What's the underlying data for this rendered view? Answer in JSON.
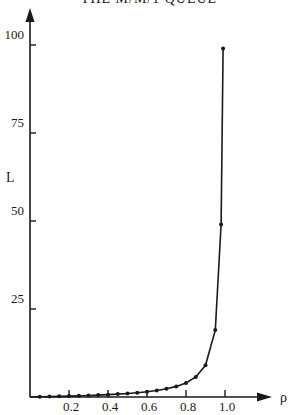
{
  "chart_data": {
    "type": "line",
    "title": "THE M/M/1 QUEUE",
    "xlabel": "ρ",
    "ylabel": "L",
    "xlim": [
      0,
      1.0
    ],
    "ylim": [
      0,
      105
    ],
    "x_ticks": [
      0.2,
      0.4,
      0.6,
      0.8,
      1.0
    ],
    "x_tick_labels": [
      "0.2",
      "0.4",
      "0.6",
      "0.8",
      "1.0"
    ],
    "y_ticks": [
      25,
      50,
      75,
      100
    ],
    "y_tick_labels": [
      "25",
      "50",
      "75",
      "100"
    ],
    "grid": false,
    "legend": null,
    "series": [
      {
        "name": "L",
        "markers": true,
        "x": [
          0.05,
          0.1,
          0.15,
          0.2,
          0.25,
          0.3,
          0.35,
          0.4,
          0.45,
          0.5,
          0.55,
          0.6,
          0.65,
          0.7,
          0.75,
          0.8,
          0.85,
          0.9,
          0.95,
          0.98,
          0.99
        ],
        "values": [
          0.05,
          0.11,
          0.18,
          0.25,
          0.33,
          0.43,
          0.54,
          0.67,
          0.82,
          1.0,
          1.22,
          1.5,
          1.86,
          2.33,
          3.0,
          4.0,
          5.67,
          9.0,
          19.0,
          49.0,
          99.0
        ]
      }
    ]
  }
}
